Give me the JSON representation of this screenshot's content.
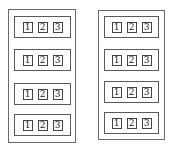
{
  "columns": [
    {
      "name": "left",
      "groups": [
        {
          "cells": [
            "1",
            "2",
            "3"
          ]
        },
        {
          "cells": [
            "1",
            "2",
            "3"
          ]
        },
        {
          "cells": [
            "1",
            "2",
            "3"
          ]
        },
        {
          "cells": [
            "1",
            "2",
            "3"
          ]
        }
      ]
    },
    {
      "name": "right",
      "groups": [
        {
          "cells": [
            "1",
            "2",
            "3"
          ]
        },
        {
          "cells": [
            "1",
            "2",
            "3"
          ]
        },
        {
          "cells": [
            "1",
            "2",
            "3"
          ]
        },
        {
          "cells": [
            "1",
            "2",
            "3"
          ]
        }
      ]
    }
  ]
}
